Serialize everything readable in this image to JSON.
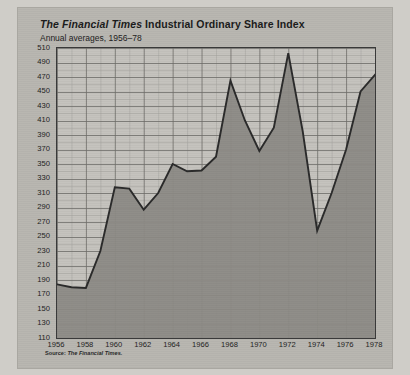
{
  "figure": {
    "title_italic": "The Financial Times",
    "title_rest": " Industrial Ordinary Share Index",
    "subtitle": "Annual averages, 1956–78",
    "source": "Source: ",
    "source_italic": "The Financial Times.",
    "colors": {
      "page_background": "#cfcdc8",
      "card_background": "#b9b7b1",
      "plot_background": "#c5c3be",
      "area_fill": "#8d8b86",
      "line": "#2b2b2b",
      "grid_minor": "#a5a39e",
      "grid_major": "#6f6d69",
      "axis": "#3a3a3a",
      "text": "#1e1e1e"
    }
  },
  "chart_data": {
    "type": "area",
    "title": "The Financial Times Industrial Ordinary Share Index",
    "subtitle": "Annual averages, 1956–78",
    "xlabel": "",
    "ylabel": "",
    "xlim": [
      1956,
      1978
    ],
    "ylim": [
      110,
      510
    ],
    "ytick_step": 20,
    "xtick_step": 2,
    "grid": true,
    "grid_minor_x_step": 1,
    "grid_minor_y_step": 10,
    "legend": "none",
    "yticks": [
      110,
      130,
      150,
      170,
      190,
      210,
      230,
      250,
      270,
      290,
      310,
      330,
      350,
      370,
      390,
      410,
      430,
      450,
      470,
      490,
      510
    ],
    "xticks": [
      1956,
      1958,
      1960,
      1962,
      1964,
      1966,
      1968,
      1970,
      1972,
      1974,
      1976,
      1978
    ],
    "x": [
      1956,
      1957,
      1958,
      1959,
      1960,
      1961,
      1962,
      1963,
      1964,
      1965,
      1966,
      1967,
      1968,
      1969,
      1970,
      1971,
      1972,
      1973,
      1974,
      1975,
      1976,
      1977,
      1978
    ],
    "values": [
      184,
      180,
      179,
      230,
      318,
      316,
      287,
      310,
      350,
      340,
      341,
      360,
      465,
      410,
      368,
      400,
      503,
      395,
      258,
      310,
      370,
      450,
      473
    ],
    "series_name": "FT Industrial Ordinary Share Index",
    "annotations": []
  }
}
